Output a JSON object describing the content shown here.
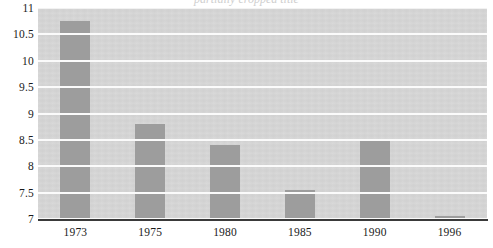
{
  "chart_data": {
    "type": "bar",
    "title": "",
    "title_remnant": "partially cropped title",
    "xlabel": "",
    "ylabel": "",
    "categories": [
      "1973",
      "1975",
      "1980",
      "1985",
      "1990",
      "1996"
    ],
    "values": [
      10.75,
      8.8,
      8.4,
      7.55,
      8.52,
      7.05
    ],
    "series": [
      {
        "name": "",
        "values": [
          10.75,
          8.8,
          8.4,
          7.55,
          8.52,
          7.05
        ]
      }
    ],
    "ylim": [
      7,
      11
    ],
    "xlim": [
      0,
      6
    ],
    "ytick_labels": [
      "11",
      "10.5",
      "10",
      "9.5",
      "9",
      "8.5",
      "8",
      "7.5",
      "7"
    ],
    "ytick_values": [
      11,
      10.5,
      10,
      9.5,
      9,
      8.5,
      8,
      7.5,
      7
    ],
    "ytick_step": 0.5,
    "grid": true,
    "grid_axis": "y",
    "legend": false,
    "legend_position": "none",
    "bar_color": "#9d9d9d",
    "plot_background": "#d5d5d5",
    "gridline_color": "#fbfbfb",
    "axis_line_color": "#3a3a3a",
    "text_color": "#1a1a1a",
    "annotations": []
  }
}
